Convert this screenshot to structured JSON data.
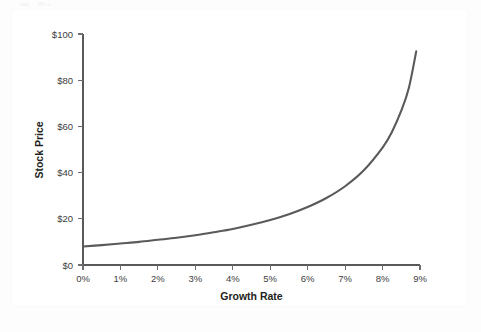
{
  "figure": {
    "background_color": "#fdfdfd",
    "plot_background_color": "#ffffff",
    "curve_color": "#5a5a5c",
    "axis_color": "#58595b",
    "text_color": "#231f20"
  },
  "chart_data": {
    "type": "line",
    "title": "",
    "xlabel": "Growth Rate",
    "ylabel": "Stock Price",
    "xlim": [
      0,
      9
    ],
    "ylim": [
      0,
      100
    ],
    "grid": false,
    "legend": null,
    "x_tick_labels": [
      "0%",
      "1%",
      "2%",
      "3%",
      "4%",
      "5%",
      "6%",
      "7%",
      "8%",
      "9%"
    ],
    "x_tick_values": [
      0,
      1,
      2,
      3,
      4,
      5,
      6,
      7,
      8,
      9
    ],
    "y_tick_labels": [
      "$0",
      "$20",
      "$40",
      "$60",
      "$80",
      "$100"
    ],
    "y_tick_values": [
      0,
      20,
      40,
      60,
      80,
      100
    ],
    "series": [
      {
        "name": "Stock Price",
        "x": [
          0,
          0.5,
          1,
          1.5,
          2,
          2.5,
          3,
          3.5,
          4,
          4.5,
          5,
          5.5,
          6,
          6.5,
          7,
          7.5,
          8,
          8.25,
          8.5,
          8.7,
          8.9
        ],
        "values": [
          8.0,
          8.6,
          9.3,
          10.0,
          10.9,
          11.8,
          12.9,
          14.2,
          15.6,
          17.4,
          19.5,
          22.0,
          25.1,
          29.0,
          34.1,
          41.0,
          50.8,
          57.6,
          66.8,
          76.5,
          92.5
        ]
      }
    ],
    "annotations": []
  },
  "axes": {
    "x_axis_name": "growth-rate-axis",
    "y_axis_name": "stock-price-axis"
  }
}
